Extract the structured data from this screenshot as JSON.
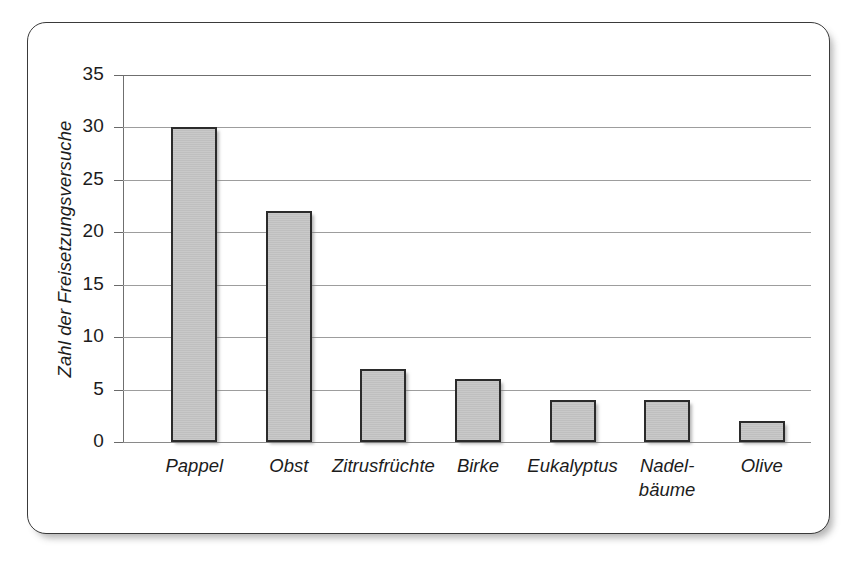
{
  "chart_data": {
    "type": "bar",
    "title": "",
    "xlabel": "",
    "ylabel": "Zahl der Freisetzungsversuche",
    "ylim": [
      0,
      35
    ],
    "ytick_step": 5,
    "yticks": [
      0,
      5,
      10,
      15,
      20,
      25,
      30,
      35
    ],
    "ytick_labels": [
      "0",
      "5",
      "10",
      "15",
      "20",
      "25",
      "30",
      "35"
    ],
    "categories": [
      "Pappel",
      "Obst",
      "Zitrusfrüchte",
      "Birke",
      "Eukalyptus",
      "Nadel-\nbäume",
      "Olive"
    ],
    "values": [
      30,
      22,
      7,
      6,
      4,
      4,
      2
    ],
    "grid": true,
    "legend": null,
    "colors": {
      "bar_fill": "#c4c4c4",
      "bar_edge": "#2b2b2b",
      "gridline": "#9d9d9d",
      "axis": "#6f6f6f",
      "text": "#1c1c1c",
      "frame": "#3a3a3a",
      "background": "#ffffff"
    }
  }
}
